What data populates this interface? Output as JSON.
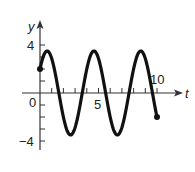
{
  "chart_data": {
    "type": "line",
    "title": "",
    "xlabel": "t",
    "ylabel": "y",
    "x_ticks_labeled": [
      "0",
      "5",
      "10"
    ],
    "y_ticks_labeled": [
      "4",
      "-4"
    ],
    "xlim": [
      0,
      10
    ],
    "ylim": [
      -4,
      4
    ],
    "grid": false,
    "legend": null,
    "function_estimate": "y = 3.5 sin(2*pi*t/4 + 0.61)",
    "series": [
      {
        "name": "y(t)",
        "x": [
          0,
          0.64,
          1.64,
          2.64,
          3.64,
          4.64,
          5.64,
          6.64,
          7.64,
          8.64,
          9.64,
          10
        ],
        "values": [
          2,
          3.5,
          0,
          -3.5,
          0,
          3.5,
          0,
          -3.5,
          0,
          3.5,
          0,
          -2
        ]
      }
    ],
    "endpoints": [
      {
        "t": 0,
        "y": 2
      },
      {
        "t": 10,
        "y": -2
      }
    ]
  },
  "labels": {
    "y_axis": "y",
    "x_axis": "t",
    "origin": "0",
    "x5": "5",
    "x10": "10",
    "y4": "4",
    "yneg4": "−4"
  }
}
